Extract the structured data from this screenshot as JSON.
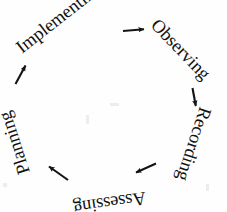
{
  "diagram": {
    "type": "cycle",
    "shape": "circular",
    "direction": "clockwise",
    "background_color": "#fefefe",
    "text_color": "#121212",
    "arrow_color": "#141414",
    "center": {
      "x": 113,
      "y": 104
    },
    "radius": 84,
    "node_count": 5,
    "nodes": [
      {
        "id": "implementing",
        "label": "Implementing",
        "angle_deg": 305,
        "text_anchor_x": 22,
        "text_anchor_y": 54,
        "rotation_deg": -38,
        "orientation": "upright"
      },
      {
        "id": "observing",
        "label": "Observing",
        "angle_deg": 18,
        "text_anchor_x": 150,
        "text_anchor_y": 26,
        "rotation_deg": 46,
        "orientation": "upright"
      },
      {
        "id": "recording",
        "label": "Recording",
        "angle_deg": 82,
        "text_anchor_x": 200,
        "text_anchor_y": 106,
        "rotation_deg": 108,
        "orientation": "rotated"
      },
      {
        "id": "assessing",
        "label": "Assessing",
        "angle_deg": 150,
        "text_anchor_x": 145,
        "text_anchor_y": 192,
        "rotation_deg": 172,
        "orientation": "inverted"
      },
      {
        "id": "planning",
        "label": "Planning",
        "angle_deg": 228,
        "text_anchor_x": 30,
        "text_anchor_y": 172,
        "rotation_deg": 252,
        "orientation": "rotated"
      }
    ],
    "arrows": [
      {
        "id": "arrow-implementing-observing",
        "from": "implementing",
        "to": "observing",
        "x1": 123,
        "y1": 31,
        "x2": 145,
        "y2": 29,
        "direction": "right"
      },
      {
        "id": "arrow-observing-recording",
        "from": "observing",
        "to": "recording",
        "x1": 193,
        "y1": 88,
        "x2": 196,
        "y2": 107,
        "direction": "down"
      },
      {
        "id": "arrow-recording-assessing",
        "from": "recording",
        "to": "assessing",
        "x1": 155,
        "y1": 164,
        "x2": 135,
        "y2": 173,
        "direction": "left-down"
      },
      {
        "id": "arrow-assessing-planning",
        "from": "assessing",
        "to": "planning",
        "x1": 68,
        "y1": 180,
        "x2": 48,
        "y2": 166,
        "direction": "left-up"
      },
      {
        "id": "arrow-planning-implementing",
        "from": "planning",
        "to": "implementing",
        "x1": 16,
        "y1": 84,
        "x2": 26,
        "y2": 65,
        "direction": "up-right"
      }
    ]
  }
}
